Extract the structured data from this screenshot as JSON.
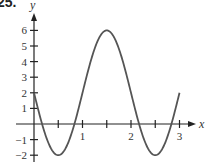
{
  "problem_label": "25.",
  "chart_data": {
    "type": "line",
    "title": "",
    "xlabel": "x",
    "ylabel": "y",
    "function": "y = 2 - 4 sin(pi x)",
    "x_ticks": [
      0.5,
      1,
      1.5,
      2,
      2.5,
      3
    ],
    "x_tick_labels": [
      "",
      "1",
      "",
      "2",
      "",
      "3"
    ],
    "y_ticks": [
      -2,
      -1,
      1,
      2,
      3,
      4,
      5,
      6
    ],
    "y_tick_labels": [
      "−2",
      "−1",
      "1",
      "2",
      "3",
      "4",
      "5",
      "6"
    ],
    "xlim": [
      -0.6,
      3.6
    ],
    "ylim": [
      -2.2,
      7
    ],
    "grid": false,
    "legend": null,
    "series": [
      {
        "name": "curve",
        "x": [
          0,
          0.25,
          0.5,
          0.75,
          1,
          1.25,
          1.5,
          1.75,
          2,
          2.25,
          2.5,
          2.75,
          3
        ],
        "values": [
          2,
          -0.83,
          -2,
          -0.83,
          2,
          4.83,
          6,
          4.83,
          2,
          -0.83,
          -2,
          -0.83,
          2
        ]
      }
    ],
    "key_points": [
      {
        "label": "y-intercept",
        "x": 0,
        "y": 2
      },
      {
        "label": "min",
        "x": 0.5,
        "y": -2
      },
      {
        "label": "max",
        "x": 1.5,
        "y": 6
      },
      {
        "label": "min",
        "x": 2.5,
        "y": -2
      },
      {
        "label": "end",
        "x": 3,
        "y": 2
      }
    ]
  }
}
